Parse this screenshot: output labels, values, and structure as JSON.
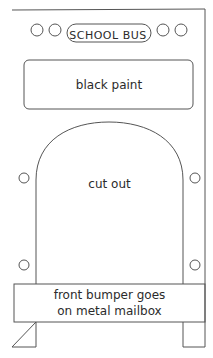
{
  "diagram": {
    "sign_label": "SCHOOL BUS",
    "top_panel_label": "black paint",
    "center_label": "cut out",
    "bumper_label_line1": "front bumper goes",
    "bumper_label_line2": "on metal mailbox",
    "stroke_color": "#555555",
    "background": "#ffffff"
  }
}
